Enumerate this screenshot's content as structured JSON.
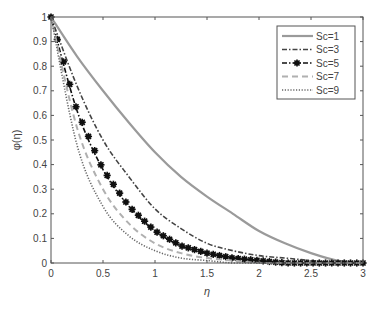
{
  "chart_data": {
    "type": "line",
    "title": "",
    "xlabel": "η",
    "ylabel": "φ(η)",
    "xlim": [
      0,
      3
    ],
    "ylim": [
      0,
      1
    ],
    "x_ticks": [
      "0",
      "0.5",
      "1",
      "1.5",
      "2",
      "2.5",
      "3"
    ],
    "y_ticks": [
      "0",
      "0.1",
      "0.2",
      "0.3",
      "0.4",
      "0.5",
      "0.6",
      "0.7",
      "0.8",
      "0.9",
      "1"
    ],
    "grid": false,
    "legend_position": "upper right",
    "x": [
      0,
      0.25,
      0.5,
      0.75,
      1,
      1.25,
      1.5,
      1.75,
      2,
      2.25,
      2.5,
      2.75,
      3
    ],
    "series": [
      {
        "name": "Sc=1",
        "style": "solid",
        "color": "#9a9a9a",
        "values": [
          1,
          0.84,
          0.7,
          0.57,
          0.45,
          0.35,
          0.27,
          0.2,
          0.13,
          0.08,
          0.04,
          0.01,
          0
        ]
      },
      {
        "name": "Sc=3",
        "style": "dashdot",
        "color": "#444444",
        "values": [
          1,
          0.72,
          0.5,
          0.35,
          0.22,
          0.14,
          0.08,
          0.05,
          0.03,
          0.02,
          0.01,
          0,
          0
        ]
      },
      {
        "name": "Sc=5",
        "style": "dashdot-marker",
        "color": "#111111",
        "values": [
          1,
          0.62,
          0.38,
          0.23,
          0.13,
          0.07,
          0.04,
          0.02,
          0.01,
          0,
          0,
          0,
          0
        ]
      },
      {
        "name": "Sc=7",
        "style": "dashed",
        "color": "#b0b0b0",
        "values": [
          1,
          0.55,
          0.3,
          0.16,
          0.08,
          0.04,
          0.02,
          0.01,
          0,
          0,
          0,
          0,
          0
        ]
      },
      {
        "name": "Sc=9",
        "style": "dotted",
        "color": "#666666",
        "values": [
          1,
          0.48,
          0.23,
          0.11,
          0.05,
          0.02,
          0.01,
          0,
          0,
          0,
          0,
          0,
          0
        ]
      }
    ]
  }
}
